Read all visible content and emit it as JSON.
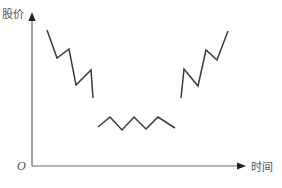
{
  "chart_data": {
    "type": "line",
    "title": "",
    "xlabel": "时间",
    "ylabel": "股价",
    "origin_label": "O",
    "grid": false,
    "legend": null,
    "tick_labels": {
      "x": [],
      "y": []
    },
    "series": [
      {
        "name": "下跌阶段",
        "points": [
          [
            47,
            30
          ],
          [
            57,
            58
          ],
          [
            69,
            49
          ],
          [
            76,
            85
          ],
          [
            91,
            70
          ],
          [
            93,
            98
          ]
        ]
      },
      {
        "name": "盘整阶段",
        "points": [
          [
            98,
            127
          ],
          [
            110,
            117
          ],
          [
            122,
            130
          ],
          [
            134,
            117
          ],
          [
            146,
            129
          ],
          [
            158,
            117
          ],
          [
            175,
            128
          ]
        ]
      },
      {
        "name": "上涨阶段",
        "points": [
          [
            181,
            98
          ],
          [
            184,
            69
          ],
          [
            198,
            86
          ],
          [
            206,
            50
          ],
          [
            217,
            60
          ],
          [
            228,
            31
          ]
        ]
      }
    ],
    "axes": {
      "origin": [
        32,
        166
      ],
      "y_axis_top": [
        32,
        12
      ],
      "x_axis_right": [
        246,
        166
      ]
    },
    "colors": {
      "line": "#3a3a3a",
      "axis": "#6b6b6b",
      "arrow": "#222222"
    }
  }
}
